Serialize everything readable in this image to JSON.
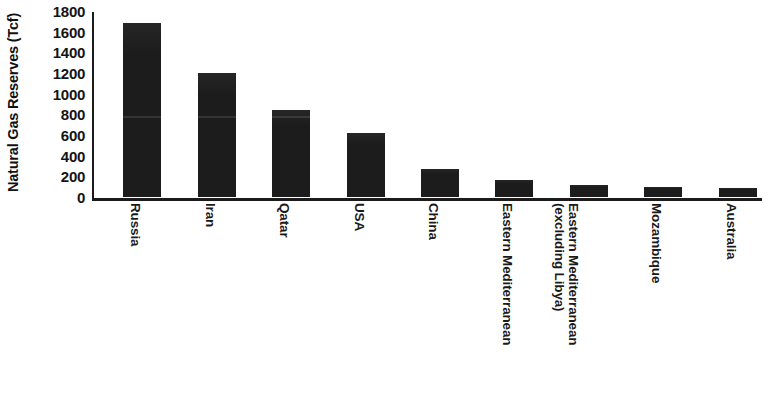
{
  "chart_data": {
    "type": "bar",
    "title": "",
    "xlabel": "",
    "ylabel": "Natural Gas Reserves (Tcf)",
    "ylim": [
      0,
      1800
    ],
    "yticks": [
      1800,
      1600,
      1400,
      1200,
      1000,
      800,
      600,
      400,
      200,
      0
    ],
    "ytick_labels": [
      "1800",
      "1600",
      "1400",
      "1200",
      "1000",
      "800",
      "600",
      "400",
      "200",
      "0"
    ],
    "grid": false,
    "legend": null,
    "bar_color": "#1c1c1c",
    "categories": [
      "Russia",
      "Iran",
      "Qatar",
      "USA",
      "China",
      "Eastern Mediterranean",
      "Eastern Mediterranean (excluding Libya)",
      "Mozambique",
      "Australia"
    ],
    "category_lines": [
      [
        "Russia"
      ],
      [
        "Iran"
      ],
      [
        "Qatar"
      ],
      [
        "USA"
      ],
      [
        "China"
      ],
      [
        "Eastern Mediterranean"
      ],
      [
        "Eastern Mediterranean",
        "(excluding Libya)"
      ],
      [
        "Mozambique"
      ],
      [
        "Australia"
      ]
    ],
    "values": [
      1688,
      1201,
      839,
      616,
      270,
      164,
      115,
      100,
      90
    ],
    "unit": "Tcf"
  },
  "axis": {
    "y_title": "Natural Gas Reserves (Tcf)",
    "ticks": [
      {
        "label": "1800",
        "value": 1800
      },
      {
        "label": "1600",
        "value": 1600
      },
      {
        "label": "1400",
        "value": 1400
      },
      {
        "label": "1200",
        "value": 1200
      },
      {
        "label": "1000",
        "value": 1000
      },
      {
        "label": "800",
        "value": 800
      },
      {
        "label": "600",
        "value": 600
      },
      {
        "label": "400",
        "value": 400
      },
      {
        "label": "200",
        "value": 200
      },
      {
        "label": "0",
        "value": 0
      }
    ]
  }
}
